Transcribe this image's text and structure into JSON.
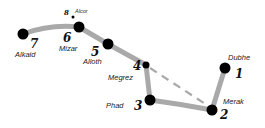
{
  "diagram": {
    "colors": {
      "line": "#a9a9a9",
      "dashed": "#a9a9a9",
      "star": "#000000",
      "text": "#222222",
      "background": "#ffffff"
    },
    "stars": [
      {
        "id": 1,
        "number": "1",
        "name": "Dubhe",
        "x": 225,
        "y": 68,
        "r": 5.5
      },
      {
        "id": 2,
        "number": "2",
        "name": "Merak",
        "x": 212,
        "y": 110,
        "r": 5.5
      },
      {
        "id": 3,
        "number": "3",
        "name": "Phad",
        "x": 150,
        "y": 100,
        "r": 5.5
      },
      {
        "id": 4,
        "number": "4",
        "name": "Megrez",
        "x": 146,
        "y": 65,
        "r": 3.5
      },
      {
        "id": 5,
        "number": "5",
        "name": "Alioth",
        "x": 108,
        "y": 44,
        "r": 5.5
      },
      {
        "id": 6,
        "number": "6",
        "name": "Mizar",
        "x": 79,
        "y": 27,
        "r": 5.5
      },
      {
        "id": 7,
        "number": "7",
        "name": "Alkaid",
        "x": 23,
        "y": 34,
        "r": 5.5
      },
      {
        "id": 8,
        "number": "8",
        "name": "Alcor",
        "x": 73,
        "y": 17,
        "r": 1.5
      }
    ],
    "labels": {
      "s1": {
        "number": "1",
        "name": "Dubhe"
      },
      "s2": {
        "number": "2",
        "name": "Merak"
      },
      "s3": {
        "number": "3",
        "name": "Phad"
      },
      "s4": {
        "number": "4",
        "name": "Megrez"
      },
      "s5": {
        "number": "5",
        "name": "Alioth"
      },
      "s6": {
        "number": "6",
        "name": "Mizar"
      },
      "s7": {
        "number": "7",
        "name": "Alkaid"
      },
      "s8": {
        "number": "8",
        "name": "Alcor"
      }
    },
    "connections": [
      {
        "from": "Alkaid",
        "to": "Mizar",
        "style": "solid"
      },
      {
        "from": "Mizar",
        "to": "Alioth",
        "style": "solid"
      },
      {
        "from": "Alioth",
        "to": "Megrez",
        "style": "solid"
      },
      {
        "from": "Megrez",
        "to": "Phad",
        "style": "solid"
      },
      {
        "from": "Phad",
        "to": "Merak",
        "style": "solid"
      },
      {
        "from": "Merak",
        "to": "Dubhe",
        "style": "solid"
      },
      {
        "from": "Megrez",
        "to": "Merak",
        "style": "dashed"
      }
    ]
  }
}
